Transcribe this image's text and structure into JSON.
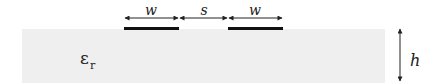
{
  "diagram": {
    "substrate": {
      "label_symbol": "ε",
      "label_subscript": "r",
      "color": "#efefef"
    },
    "conductors": [
      {
        "name": "left-strip",
        "width_label": "w"
      },
      {
        "name": "right-strip",
        "width_label": "w"
      }
    ],
    "dimensions": {
      "left_width_label": "w",
      "gap_label": "s",
      "right_width_label": "w",
      "height_label": "h"
    },
    "colors": {
      "conductor": "#111111",
      "dimension_line": "#222222",
      "substrate": "#efefef"
    }
  }
}
